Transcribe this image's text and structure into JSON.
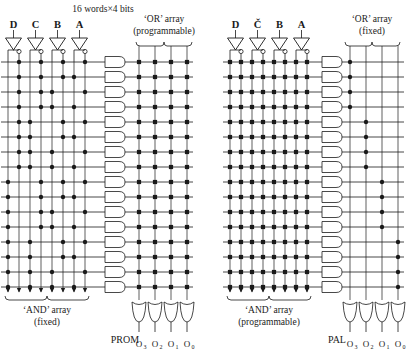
{
  "figure": {
    "title_top": "16 words×4 bits",
    "panels": [
      {
        "id": "prom",
        "caption": "PROM",
        "inputs": [
          "D",
          "C",
          "B",
          "A"
        ],
        "and_array_label_line1": "‘AND’ array",
        "and_array_label_line2": "(fixed)",
        "or_array_label_line1": "‘OR’ array",
        "or_array_label_line2": "(programmable)",
        "outputs": [
          "O",
          "O",
          "O",
          "O"
        ],
        "output_subscripts": [
          "3",
          "2",
          "1",
          "0"
        ],
        "rows": 16,
        "and_columns": 8,
        "or_columns": 4,
        "and_programmable": false,
        "or_programmable": true
      },
      {
        "id": "pal",
        "caption": "PAL",
        "inputs": [
          "D",
          "Č",
          "B",
          "A"
        ],
        "and_array_label_line1": "‘AND’ array",
        "and_array_label_line2": "(programmable)",
        "or_array_label_line1": "‘OR’ array",
        "or_array_label_line2": "(fixed)",
        "outputs": [
          "O",
          "O",
          "O",
          "O"
        ],
        "output_subscripts": [
          "3",
          "2",
          "1",
          "0"
        ],
        "rows": 16,
        "and_columns": 8,
        "or_columns": 4,
        "and_programmable": true,
        "or_programmable": false
      }
    ],
    "colors": {
      "ink": "#1a1a1a",
      "paper": "#ffffff"
    }
  },
  "chart_data": {
    "type": "diagram",
    "title": "16 words×4 bits",
    "prom_and_dots": [
      [
        1,
        3,
        5,
        7
      ],
      [
        1,
        3,
        5,
        6
      ],
      [
        1,
        3,
        4,
        7
      ],
      [
        1,
        3,
        4,
        6
      ],
      [
        1,
        2,
        5,
        7
      ],
      [
        1,
        2,
        5,
        6
      ],
      [
        1,
        2,
        4,
        7
      ],
      [
        1,
        2,
        4,
        6
      ],
      [
        0,
        3,
        5,
        7
      ],
      [
        0,
        3,
        5,
        6
      ],
      [
        0,
        3,
        4,
        7
      ],
      [
        0,
        3,
        4,
        6
      ],
      [
        0,
        2,
        5,
        7
      ],
      [
        0,
        2,
        5,
        6
      ],
      [
        0,
        2,
        4,
        7
      ],
      [
        0,
        2,
        4,
        6
      ]
    ],
    "pal_or_fixed_map": [
      0,
      0,
      0,
      0,
      1,
      1,
      1,
      1,
      2,
      2,
      2,
      2,
      3,
      3,
      3,
      3
    ]
  }
}
